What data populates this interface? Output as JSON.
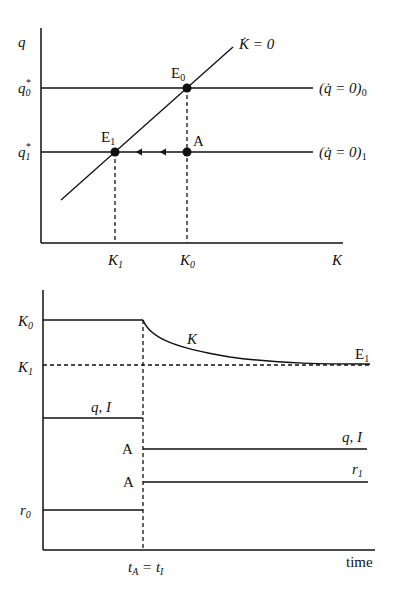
{
  "top_panel": {
    "y_axis_label": "q",
    "x_axis_label": "K",
    "y_ticks": [
      {
        "base": "q",
        "sup": "*",
        "sub": "0"
      },
      {
        "base": "q",
        "sup": "*",
        "sub": "1"
      }
    ],
    "x_ticks": [
      {
        "base": "K",
        "sub": "1"
      },
      {
        "base": "K",
        "sub": "0"
      }
    ],
    "curves": {
      "kdot_zero": "K̇ = 0",
      "qdot_zero_0": {
        "text": "(q̇ = 0)",
        "sub": "0"
      },
      "qdot_zero_1": {
        "text": "(q̇ = 0)",
        "sub": "1"
      }
    },
    "points": {
      "E0": {
        "base": "E",
        "sub": "0"
      },
      "E1": {
        "base": "E",
        "sub": "1"
      },
      "A": "A"
    }
  },
  "bottom_panel": {
    "x_axis_label": "time",
    "y_ticks": [
      {
        "base": "K",
        "sub": "0"
      },
      {
        "base": "K",
        "sub": "1"
      },
      {
        "base": "r",
        "sub": "0"
      }
    ],
    "event_label": {
      "left": "t",
      "left_sub": "A",
      "eq": " = ",
      "right": "t",
      "right_sub": "I"
    },
    "series_labels": {
      "K": "K",
      "E1": {
        "base": "E",
        "sub": "1"
      },
      "qI_before": "q, I",
      "qI_after": "q, I",
      "r1": {
        "base": "r",
        "sub": "1"
      },
      "A_upper": "A",
      "A_lower": "A"
    }
  }
}
